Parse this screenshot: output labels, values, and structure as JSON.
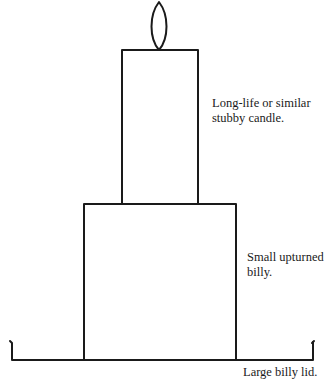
{
  "diagram": {
    "stroke_color": "#1a1a1a",
    "background": "#ffffff",
    "parts": {
      "flame": {
        "cx": 159,
        "top": 1,
        "bottom": 50,
        "half_width": 8
      },
      "candle": {
        "x": 122,
        "y": 50,
        "width": 76,
        "height": 154
      },
      "billy": {
        "x": 84,
        "y": 204,
        "width": 152,
        "height": 156
      },
      "lid": {
        "y": 360,
        "left": 11,
        "right": 313,
        "hook_top": 342
      }
    },
    "labels": {
      "candle": {
        "line1": "Long-life or similar",
        "line2": "stubby candle."
      },
      "billy": {
        "line1": "Small upturned",
        "line2": "billy."
      },
      "lid": {
        "line1": "Large billy lid."
      }
    }
  }
}
